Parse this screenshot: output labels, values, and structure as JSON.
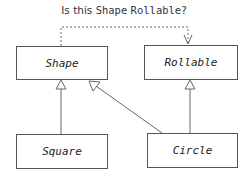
{
  "question": {
    "prefix": "Is this ",
    "shape": "Shape",
    "space": " ",
    "rollable": "Rollable",
    "suffix": "?"
  },
  "boxes": {
    "shape": "Shape",
    "rollable": "Rollable",
    "square": "Square",
    "circle": "Circle"
  },
  "colors": {
    "line": "#555555",
    "text": "#222222"
  }
}
